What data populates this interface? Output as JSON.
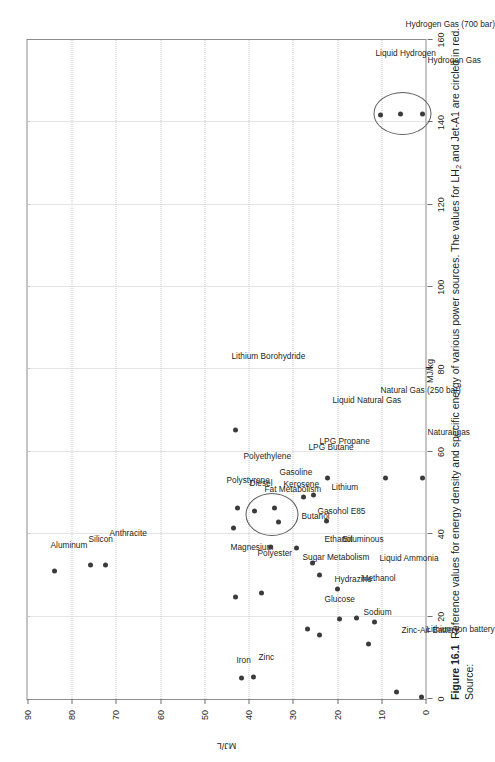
{
  "figure": {
    "number": "Figure 16.1",
    "caption_text": "Reference values for energy density and specific energy of various power sources. The values for LH",
    "caption_sub": "2",
    "caption_tail": " and Jet-A1 are circled in red. Source:"
  },
  "chart_data": {
    "type": "scatter",
    "title": "",
    "xlabel": "MJ/kg",
    "ylabel": "MJ/L",
    "xlim": [
      0,
      160
    ],
    "ylim": [
      0,
      90
    ],
    "xticks": [
      0,
      20,
      40,
      60,
      80,
      100,
      120,
      140,
      160
    ],
    "xticklabels": [
      "0",
      "20",
      "40",
      "60",
      "80",
      "100",
      "120",
      "140",
      "160"
    ],
    "yticks": [
      0,
      10,
      20,
      30,
      40,
      50,
      60,
      70,
      80,
      90
    ],
    "yticklabels": [
      "0",
      "10",
      "20",
      "30",
      "40",
      "50",
      "60",
      "70",
      "80",
      "90"
    ],
    "grid": true,
    "legend": "none",
    "accent_color": "#3b3b3b",
    "grid_color": "#c9c9c9",
    "axis_color": "#8c8c8c",
    "points": [
      {
        "label": "Aluminum",
        "x": 31.0,
        "y": 83.8,
        "lx": -4,
        "ly": -30,
        "rot": 0
      },
      {
        "label": "Silicon",
        "x": 32.6,
        "y": 75.8,
        "lx": -2,
        "ly": -30,
        "rot": 0
      },
      {
        "label": "Anthracite",
        "x": 32.5,
        "y": 72.4,
        "lx": 4,
        "ly": -36,
        "rot": 0
      },
      {
        "label": "Lithium Borohydride",
        "x": 65.2,
        "y": 43.0,
        "lx": -4,
        "ly": -78,
        "rot": 0
      },
      {
        "label": "Polystyrene",
        "x": 41.4,
        "y": 43.5,
        "lx": -7,
        "ly": -52,
        "rot": 0
      },
      {
        "label": "Polyethylene",
        "x": 46.3,
        "y": 42.6,
        "lx": 6,
        "ly": -56,
        "rot": 0
      },
      {
        "label": "Magnesium",
        "x": 24.7,
        "y": 43.0,
        "lx": -5,
        "ly": -54,
        "rot": 0
      },
      {
        "label": "Diesel",
        "x": 45.6,
        "y": 38.6,
        "lx": -5,
        "ly": -32,
        "rot": 0
      },
      {
        "label": "Gasoline",
        "x": 46.4,
        "y": 34.2,
        "lx": 5,
        "ly": -40,
        "rot": 0
      },
      {
        "label": "Fat Metabolism",
        "x": 37.0,
        "y": 35.0,
        "lx": -6,
        "ly": -62,
        "rot": 0
      },
      {
        "label": "Kerosene",
        "x": 43.0,
        "y": 33.3,
        "lx": 5,
        "ly": -42,
        "rot": 0
      },
      {
        "label": "Polyester",
        "x": 25.8,
        "y": 37.0,
        "lx": -4,
        "ly": -44,
        "rot": 0
      },
      {
        "label": "Butanol",
        "x": 36.6,
        "y": 29.2,
        "lx": 5,
        "ly": -36,
        "rot": 0
      },
      {
        "label": "LPG Butane",
        "x": 49.1,
        "y": 27.7,
        "lx": 5,
        "ly": -54,
        "rot": 0
      },
      {
        "label": "LPG Propane",
        "x": 49.6,
        "y": 25.3,
        "lx": 6,
        "ly": -58,
        "rot": 0
      },
      {
        "label": "Gasohol E85",
        "x": 33.1,
        "y": 25.6,
        "lx": 5,
        "ly": -56,
        "rot": 0
      },
      {
        "label": "Ethanol",
        "x": 30.0,
        "y": 24.0,
        "lx": 5,
        "ly": -40,
        "rot": 0
      },
      {
        "label": "Liquid Natural Gas",
        "x": 53.6,
        "y": 22.2,
        "lx": 5,
        "ly": -82,
        "rot": 0
      },
      {
        "label": "Lithium",
        "x": 43.1,
        "y": 22.3,
        "lx": 5,
        "ly": -38,
        "rot": 0
      },
      {
        "label": "Bituminous",
        "x": 26.7,
        "y": 20.0,
        "lx": 5,
        "ly": -54,
        "rot": 0
      },
      {
        "label": "Sugar Metabolism",
        "x": 17.0,
        "y": 26.6,
        "lx": -5,
        "ly": -76,
        "rot": 0
      },
      {
        "label": "Glucose",
        "x": 15.6,
        "y": 23.9,
        "lx": 5,
        "ly": -40,
        "rot": 0
      },
      {
        "label": "Hydrazine",
        "x": 19.5,
        "y": 19.5,
        "lx": -5,
        "ly": -44,
        "rot": 0
      },
      {
        "label": "Methanol",
        "x": 19.7,
        "y": 15.6,
        "lx": 5,
        "ly": -44,
        "rot": 0
      },
      {
        "label": "Sodium",
        "x": 13.3,
        "y": 12.8,
        "lx": -5,
        "ly": -36,
        "rot": 0
      },
      {
        "label": "Liquid Ammonia",
        "x": 18.6,
        "y": 11.5,
        "lx": 5,
        "ly": -68,
        "rot": 0
      },
      {
        "label": "Iron",
        "x": 5.2,
        "y": 41.5,
        "lx": -5,
        "ly": -22,
        "rot": 0
      },
      {
        "label": "Zinc",
        "x": 5.3,
        "y": 38.8,
        "lx": 5,
        "ly": -24,
        "rot": 0
      },
      {
        "label": "Natural Gas (250 bar)",
        "x": 53.6,
        "y": 9.1,
        "lx": -5,
        "ly": -92,
        "rot": 0
      },
      {
        "label": "Zinc-Air Battery",
        "x": 1.6,
        "y": 6.5,
        "lx": 5,
        "ly": -66,
        "rot": 0
      },
      {
        "label": "Lithium Ion battery",
        "x": 0.5,
        "y": 1.0,
        "lx": 5,
        "ly": -72,
        "rot": 0
      },
      {
        "label": "Liquid Hydrogen",
        "x": 141.9,
        "y": 10.1,
        "lx": -5,
        "ly": -66,
        "rot": 0
      },
      {
        "label": "Hydrogen Gas (700 bar)",
        "x": 142.0,
        "y": 5.6,
        "lx": 5,
        "ly": -94,
        "rot": 0
      },
      {
        "label": "Hydrogen Gas",
        "x": 142.0,
        "y": 0.7,
        "lx": 5,
        "ly": -58,
        "rot": 0
      },
      {
        "label": "Natural gas",
        "x": 53.6,
        "y": 0.6,
        "lx": 5,
        "ly": -50,
        "rot": 0
      }
    ],
    "annotations": [
      {
        "name": "circle-fuels",
        "cx": 44.5,
        "cy": 35.0,
        "rx": 5.0,
        "ry": 5.8
      },
      {
        "name": "circle-hydrogen",
        "cx": 142.0,
        "cy": 5.4,
        "rx": 5.0,
        "ry": 6.4
      }
    ]
  }
}
